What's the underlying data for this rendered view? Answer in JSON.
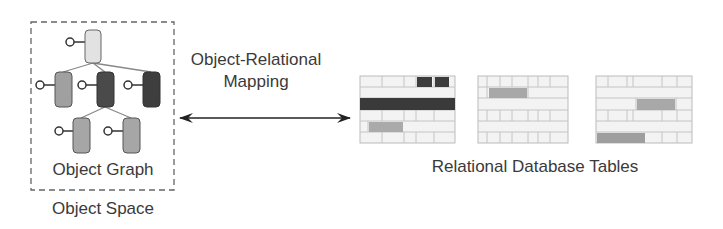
{
  "object_space": {
    "container_label": "Object Space",
    "graph_label": "Object Graph",
    "nodes": [
      {
        "id": "root",
        "fill": "#e2e2e2"
      },
      {
        "id": "child-left",
        "fill": "#a0a0a0"
      },
      {
        "id": "child-center",
        "fill": "#4a4a4a"
      },
      {
        "id": "child-right",
        "fill": "#3e3e3e"
      },
      {
        "id": "grandchild-left",
        "fill": "#a6a6a6"
      },
      {
        "id": "grandchild-right",
        "fill": "#a6a6a6"
      }
    ]
  },
  "mapping": {
    "label_line1": "Object-Relational",
    "label_line2": "Mapping"
  },
  "relational": {
    "label": "Relational Database Tables",
    "tables": [
      {
        "id": "table-1",
        "highlight_colors": [
          "#3c3c3c",
          "#3a3a3a",
          "#aaaaaa"
        ]
      },
      {
        "id": "table-2",
        "highlight_colors": [
          "#a8a8a8"
        ]
      },
      {
        "id": "table-3",
        "highlight_colors": [
          "#a8a8a8",
          "#9e9e9e"
        ]
      }
    ]
  },
  "colors": {
    "line": "#555555",
    "table_grid": "#bdbdbd",
    "table_cell": "#f2f2f2",
    "dashed_border": "#666666"
  }
}
